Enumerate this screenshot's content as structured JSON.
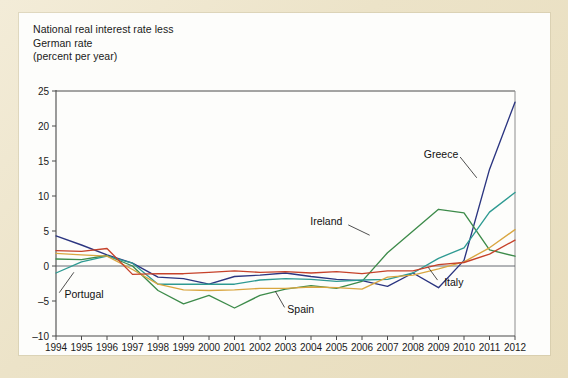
{
  "figure": {
    "title_lines": "National real interest rate less\nGerman rate\n(percent per year)",
    "background_color": "#ece3c8",
    "paper_color": "#fdfdfb"
  },
  "chart_data": {
    "type": "line",
    "title": "National real interest rate less German rate (percent per year)",
    "xlabel": "",
    "ylabel": "percent per year",
    "ylim": [
      -10,
      25
    ],
    "xlim": [
      1994,
      2012
    ],
    "yticks": [
      -10,
      -5,
      0,
      5,
      10,
      15,
      20,
      25
    ],
    "ytick_labels": [
      "–10",
      "–5",
      "0",
      "5",
      "10",
      "15",
      "20",
      "25"
    ],
    "grid": false,
    "zero_line": true,
    "legend": "inline-annotations",
    "x": [
      1994,
      1995,
      1996,
      1997,
      1998,
      1999,
      2000,
      2001,
      2002,
      2003,
      2004,
      2005,
      2006,
      2007,
      2008,
      2009,
      2010,
      2011,
      2012
    ],
    "xtick_labels": [
      "1994",
      "1995",
      "1996",
      "1997",
      "1998",
      "1999",
      "2000",
      "2001",
      "2002",
      "2003",
      "2004",
      "2005",
      "2006",
      "2007",
      "2008",
      "2009",
      "2010",
      "2011",
      "2012"
    ],
    "series": [
      {
        "name": "Greece",
        "color": "#2b3580",
        "label_x": 2009.1,
        "label_y": 16.0,
        "leader_to_x": 2010.5,
        "leader_to_y": 12.6,
        "values": [
          4.3,
          3.0,
          1.6,
          0.4,
          -1.6,
          -1.8,
          -2.6,
          -1.5,
          -1.3,
          -1.0,
          -1.5,
          -1.9,
          -2.1,
          -2.9,
          -1.0,
          -3.1,
          0.8,
          13.8,
          23.4
        ]
      },
      {
        "name": "Ireland",
        "color": "#3d8b4a",
        "label_x": 2004.6,
        "label_y": 6.3,
        "leader_to_x": 2006.3,
        "leader_to_y": 4.4,
        "values": [
          1.0,
          0.9,
          1.5,
          0.0,
          -3.5,
          -5.4,
          -4.2,
          -6.0,
          -4.2,
          -3.3,
          -2.8,
          -3.2,
          -2.2,
          1.9,
          5.0,
          8.1,
          7.6,
          2.3,
          1.4
        ]
      },
      {
        "name": "Portugal",
        "color": "#2e9a92",
        "label_x": 1995.1,
        "label_y": -4.1,
        "leader_to_x": 1994.7,
        "leader_to_y": -0.9,
        "values": [
          -1.0,
          0.6,
          1.4,
          0.4,
          -2.6,
          -2.6,
          -2.6,
          -2.6,
          -2.0,
          -1.8,
          -1.9,
          -2.2,
          -2.0,
          -1.9,
          -1.0,
          1.1,
          2.6,
          7.7,
          10.5
        ]
      },
      {
        "name": "Spain",
        "color": "#d9a640",
        "label_x": 2003.6,
        "label_y": -6.2,
        "leader_to_x": 2002.6,
        "leader_to_y": -3.6,
        "values": [
          1.8,
          1.6,
          1.4,
          -0.5,
          -2.6,
          -3.4,
          -3.5,
          -3.4,
          -3.2,
          -3.2,
          -3.0,
          -3.1,
          -3.3,
          -1.6,
          -1.3,
          -0.4,
          0.6,
          2.6,
          5.2
        ]
      },
      {
        "name": "Italy",
        "color": "#c6422a",
        "label_x": 2009.6,
        "label_y": -2.3,
        "leader_to_x": 2008.6,
        "leader_to_y": -0.2,
        "values": [
          2.2,
          2.1,
          2.5,
          -1.2,
          -1.1,
          -1.1,
          -0.9,
          -0.7,
          -0.9,
          -0.8,
          -1.0,
          -0.8,
          -1.1,
          -0.7,
          -0.7,
          0.2,
          0.5,
          1.7,
          3.7
        ]
      }
    ]
  }
}
